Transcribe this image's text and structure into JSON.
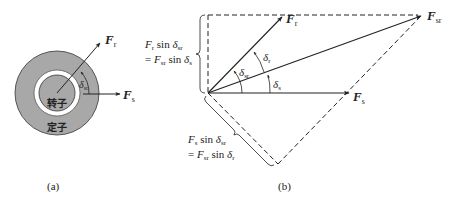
{
  "panel_a": {
    "caption": "(a)",
    "rotor_label": "转子",
    "stator_label": "定子",
    "vectors": {
      "Fr": {
        "main": "F",
        "sub": "r"
      },
      "Fs": {
        "main": "F",
        "sub": "s"
      }
    },
    "angle": {
      "main": "δ",
      "sub": "sr"
    },
    "colors": {
      "stator": "#a8a8a8",
      "rotor": "#a8a8a8",
      "gap": "#ffffff",
      "line": "#222222"
    }
  },
  "panel_b": {
    "caption": "(b)",
    "vectors": {
      "Fr": {
        "main": "F",
        "sub": "r"
      },
      "Fs": {
        "main": "F",
        "sub": "s"
      },
      "Fsr": {
        "main": "F",
        "sub": "sr"
      }
    },
    "angles": {
      "delta_sr": {
        "main": "δ",
        "sub": "sr"
      },
      "delta_r": {
        "main": "δ",
        "sub": "r"
      },
      "delta_s": {
        "main": "δ",
        "sub": "s"
      }
    },
    "brace_upper": {
      "line1": {
        "F": "F",
        "Fsub": "r",
        "sin": " sin ",
        "d": "δ",
        "dsub": "sr"
      },
      "line2": {
        "eq": "= ",
        "F": "F",
        "Fsub": "sr",
        "sin": " sin ",
        "d": "δ",
        "dsub": "s"
      }
    },
    "brace_lower": {
      "line1": {
        "F": "F",
        "Fsub": "s",
        "sin": " sin ",
        "d": "δ",
        "dsub": "sr"
      },
      "line2": {
        "eq": "= ",
        "F": "F",
        "Fsub": "sr",
        "sin": " sin ",
        "d": "δ",
        "dsub": "r"
      }
    }
  }
}
